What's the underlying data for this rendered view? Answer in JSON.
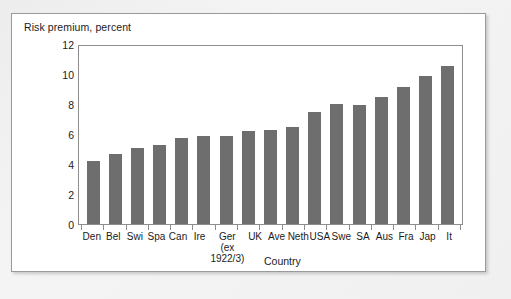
{
  "figure": {
    "title": "Risk premium, percent",
    "axis_title_x": "Country",
    "bar_color": "#6e6e6e",
    "frame_color": "#8d8d8d",
    "text_color": "#1b1b1b"
  },
  "chart_data": {
    "type": "bar",
    "title": "Risk premium, percent",
    "xlabel": "Country",
    "ylabel": "Risk premium, percent",
    "ylim": [
      0,
      12
    ],
    "yticks": [
      0,
      2,
      4,
      6,
      8,
      10,
      12
    ],
    "grid": false,
    "legend": null,
    "categories": [
      "Den",
      "Bel",
      "Swi",
      "Spa",
      "Can",
      "Ire",
      "Ger",
      "UK",
      "Ave",
      "Neth",
      "USA",
      "Swe",
      "SA",
      "Aus",
      "Fra",
      "Jap",
      "It"
    ],
    "category_sublabels": {
      "Ger": [
        "(ex",
        "1922/3)"
      ]
    },
    "values": [
      4.2,
      4.7,
      5.1,
      5.3,
      5.75,
      5.85,
      5.85,
      6.2,
      6.3,
      6.45,
      7.5,
      8.0,
      7.95,
      8.5,
      9.15,
      9.9,
      10.55
    ]
  }
}
